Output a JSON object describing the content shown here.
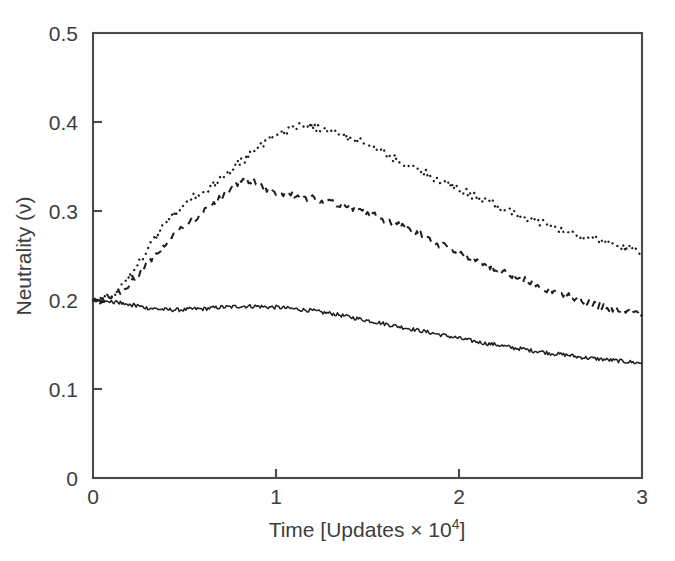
{
  "chart_data": {
    "type": "line",
    "title": "",
    "xlabel": "Time [Updates × 10⁴]",
    "ylabel": "Neutrality (ν)",
    "xlim": [
      0,
      3
    ],
    "ylim": [
      0,
      0.5
    ],
    "xticks": [
      0,
      1,
      2,
      3
    ],
    "xtick_labels": [
      "0",
      "1",
      "2",
      "3"
    ],
    "yticks": [
      0,
      0.1,
      0.2,
      0.3,
      0.4,
      0.5
    ],
    "ytick_labels": [
      "0",
      "0.1",
      "0.2",
      "0.3",
      "0.4",
      "0.5"
    ],
    "grid": false,
    "legend": "none",
    "frame": "box",
    "series": [
      {
        "name": "dotted-upper",
        "style": "dotted",
        "color": "#1d1d1d",
        "x": [
          0.0,
          0.05,
          0.1,
          0.15,
          0.2,
          0.25,
          0.3,
          0.35,
          0.4,
          0.45,
          0.5,
          0.55,
          0.6,
          0.65,
          0.7,
          0.75,
          0.8,
          0.85,
          0.9,
          0.95,
          1.0,
          1.05,
          1.1,
          1.15,
          1.2,
          1.25,
          1.3,
          1.35,
          1.4,
          1.45,
          1.5,
          1.55,
          1.6,
          1.65,
          1.7,
          1.75,
          1.8,
          1.85,
          1.9,
          1.95,
          2.0,
          2.05,
          2.1,
          2.15,
          2.2,
          2.25,
          2.3,
          2.35,
          2.4,
          2.45,
          2.5,
          2.55,
          2.6,
          2.65,
          2.7,
          2.75,
          2.8,
          2.85,
          2.9,
          2.95,
          3.0
        ],
        "y": [
          0.2,
          0.201,
          0.204,
          0.213,
          0.226,
          0.242,
          0.258,
          0.272,
          0.286,
          0.298,
          0.308,
          0.315,
          0.322,
          0.328,
          0.336,
          0.345,
          0.354,
          0.362,
          0.37,
          0.378,
          0.385,
          0.39,
          0.394,
          0.396,
          0.395,
          0.392,
          0.389,
          0.386,
          0.383,
          0.379,
          0.374,
          0.369,
          0.364,
          0.359,
          0.354,
          0.349,
          0.344,
          0.339,
          0.334,
          0.329,
          0.324,
          0.32,
          0.315,
          0.311,
          0.306,
          0.302,
          0.298,
          0.294,
          0.29,
          0.287,
          0.283,
          0.28,
          0.277,
          0.274,
          0.271,
          0.268,
          0.265,
          0.262,
          0.259,
          0.257,
          0.255
        ]
      },
      {
        "name": "dashed-middle",
        "style": "dashed",
        "color": "#1d1d1d",
        "x": [
          0.0,
          0.05,
          0.1,
          0.15,
          0.2,
          0.25,
          0.3,
          0.35,
          0.4,
          0.45,
          0.5,
          0.55,
          0.6,
          0.65,
          0.7,
          0.75,
          0.8,
          0.85,
          0.9,
          0.95,
          1.0,
          1.05,
          1.1,
          1.15,
          1.2,
          1.25,
          1.3,
          1.35,
          1.4,
          1.45,
          1.5,
          1.55,
          1.6,
          1.65,
          1.7,
          1.75,
          1.8,
          1.85,
          1.9,
          1.95,
          2.0,
          2.05,
          2.1,
          2.15,
          2.2,
          2.25,
          2.3,
          2.35,
          2.4,
          2.45,
          2.5,
          2.55,
          2.6,
          2.65,
          2.7,
          2.75,
          2.8,
          2.85,
          2.9,
          2.95,
          3.0
        ],
        "y": [
          0.199,
          0.2,
          0.202,
          0.208,
          0.217,
          0.229,
          0.242,
          0.254,
          0.265,
          0.275,
          0.284,
          0.291,
          0.298,
          0.306,
          0.315,
          0.325,
          0.332,
          0.335,
          0.33,
          0.325,
          0.322,
          0.32,
          0.318,
          0.316,
          0.314,
          0.312,
          0.31,
          0.308,
          0.305,
          0.302,
          0.298,
          0.294,
          0.29,
          0.286,
          0.281,
          0.277,
          0.272,
          0.267,
          0.262,
          0.258,
          0.253,
          0.248,
          0.244,
          0.239,
          0.235,
          0.231,
          0.227,
          0.223,
          0.219,
          0.215,
          0.211,
          0.208,
          0.205,
          0.201,
          0.198,
          0.195,
          0.192,
          0.189,
          0.187,
          0.185,
          0.184
        ]
      },
      {
        "name": "solid-lower",
        "style": "solid",
        "color": "#1d1d1d",
        "x": [
          0.0,
          0.05,
          0.1,
          0.15,
          0.2,
          0.25,
          0.3,
          0.35,
          0.4,
          0.45,
          0.5,
          0.55,
          0.6,
          0.65,
          0.7,
          0.75,
          0.8,
          0.85,
          0.9,
          0.95,
          1.0,
          1.05,
          1.1,
          1.15,
          1.2,
          1.25,
          1.3,
          1.35,
          1.4,
          1.45,
          1.5,
          1.55,
          1.6,
          1.65,
          1.7,
          1.75,
          1.8,
          1.85,
          1.9,
          1.95,
          2.0,
          2.05,
          2.1,
          2.15,
          2.2,
          2.25,
          2.3,
          2.35,
          2.4,
          2.45,
          2.5,
          2.55,
          2.6,
          2.65,
          2.7,
          2.75,
          2.8,
          2.85,
          2.9,
          2.95,
          3.0
        ],
        "y": [
          0.199,
          0.199,
          0.198,
          0.197,
          0.195,
          0.193,
          0.191,
          0.19,
          0.189,
          0.189,
          0.189,
          0.19,
          0.19,
          0.191,
          0.192,
          0.192,
          0.193,
          0.193,
          0.193,
          0.192,
          0.192,
          0.191,
          0.19,
          0.189,
          0.188,
          0.186,
          0.185,
          0.183,
          0.181,
          0.179,
          0.177,
          0.175,
          0.173,
          0.171,
          0.169,
          0.167,
          0.165,
          0.163,
          0.161,
          0.159,
          0.157,
          0.155,
          0.153,
          0.151,
          0.15,
          0.148,
          0.146,
          0.145,
          0.143,
          0.142,
          0.14,
          0.139,
          0.138,
          0.136,
          0.135,
          0.134,
          0.133,
          0.132,
          0.131,
          0.13,
          0.129
        ]
      }
    ]
  },
  "axis": {
    "x_title": "Time [Updates × 10",
    "x_title_exp": "4",
    "x_title_tail": "]",
    "y_title": "Neutrality (ν)"
  },
  "colors": {
    "background": "#ffffff",
    "axis": "#4a4a4a",
    "text": "#3d3d3d",
    "series": "#1d1d1d"
  }
}
